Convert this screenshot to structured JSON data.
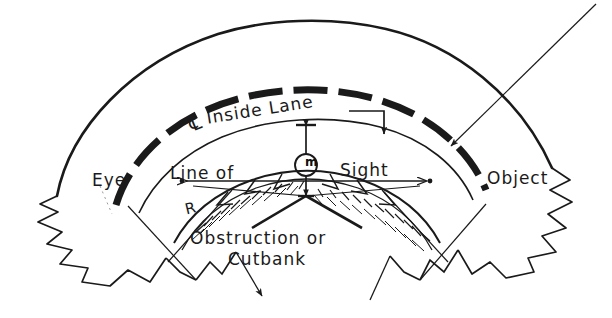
{
  "diagram": {
    "type": "engineering-sketch",
    "style": "hand-drawn line drawing, black ink on white",
    "ink_color": "#1a1a1a",
    "background_color": "#ffffff"
  },
  "labels": {
    "eye": "Eye",
    "object": "Object",
    "centerline_symbol": "℄",
    "inside_lane": "Inside Lane",
    "line_of_sight_left": "Line of",
    "line_of_sight_right": "Sight",
    "obstruction": "Obstruction or",
    "cutbank": "Cutbank",
    "radius": "R",
    "middle_ordinate": "m"
  },
  "annotations": {
    "inside_lane_leader": "elbow leader with down arrow pointing to inside-lane arc",
    "external_leader": "long thin diagonal leader from upper right to inside-lane arc, arrowhead down-left",
    "cutbank_leader_left": "leader from Cutbank going down-left with arrowhead",
    "cutbank_leader_right": "leader from Cutbank going down-right",
    "sight_line": "straight chord with arrowheads at Eye and Object",
    "middle_ordinate_dim": "vertical dimension line with arrowheads through circled m"
  },
  "geometry": {
    "sight_chord_y": 181,
    "eye_point": [
      181,
      181
    ],
    "object_point": [
      431,
      181
    ],
    "curve_center_x": 306,
    "outer_edge_radius": 268,
    "inside_lane_radius": 196,
    "inner_edge_radius": 172,
    "obstruction_radius": 140
  }
}
